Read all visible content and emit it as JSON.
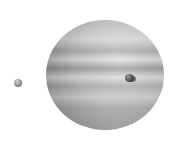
{
  "scene": {
    "subject": "Gas giant planet (Jupiter-like) with two moons, grayscale",
    "objects": [
      {
        "name": "planet",
        "shape": "banded sphere"
      },
      {
        "name": "moon-left",
        "position": "left of planet"
      },
      {
        "name": "moon-transit",
        "position": "in front of planet, right side, with shadow"
      }
    ],
    "colors": {
      "background": "#ffffff",
      "planet_light": "#e4e4e4",
      "planet_dark": "#6a6a6a",
      "moon_dark": "#2a2a2a"
    }
  }
}
